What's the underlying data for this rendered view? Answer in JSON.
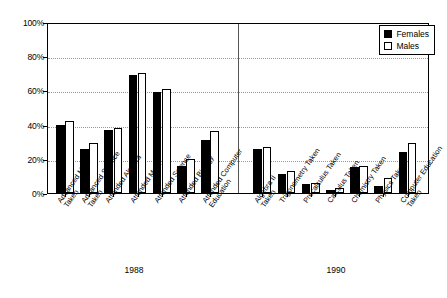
{
  "chart_data": {
    "type": "bar",
    "title": "",
    "xlabel": "",
    "ylabel": "",
    "ylim": [
      0,
      100
    ],
    "grid": true,
    "legend_position": "top-right",
    "y_ticks": [
      "0%",
      "20%",
      "40%",
      "60%",
      "80%",
      "100%"
    ],
    "y_tick_values": [
      0,
      20,
      40,
      60,
      80,
      100
    ],
    "categories": [
      "Advanced Math Taken",
      "Advanced Science Taken",
      "Attended Algebra",
      "Attended Math",
      "Attended Science",
      "Attended Biology",
      "Attended Computer Education",
      "Algebra II Taken",
      "Trigonometry Taken",
      "Precalculus Taken",
      "Calculus Taken",
      "Chemistry Taken",
      "Physics Taken",
      "Computer Education Taken"
    ],
    "series": [
      {
        "name": "Females",
        "color": "#000000",
        "values": [
          40,
          26,
          37,
          69,
          59,
          16,
          31,
          26,
          11,
          5,
          2,
          15,
          4,
          24
        ]
      },
      {
        "name": "Males",
        "color": "#ffffff",
        "values": [
          42,
          29,
          38,
          70,
          61,
          20,
          36,
          27,
          13,
          6,
          3,
          16,
          9,
          29
        ]
      }
    ],
    "groups": [
      {
        "label": "1988",
        "categories": [
          0,
          1,
          2,
          3,
          4,
          5,
          6
        ]
      },
      {
        "label": "1990",
        "categories": [
          7,
          8,
          9,
          10,
          11,
          12,
          13
        ]
      }
    ]
  },
  "legend": {
    "entries": [
      {
        "label": "Females",
        "swatch": "filled-black-square"
      },
      {
        "label": "Males",
        "swatch": "outlined-white-square"
      }
    ]
  },
  "axis": {
    "year_labels": [
      "1988",
      "1990"
    ]
  }
}
